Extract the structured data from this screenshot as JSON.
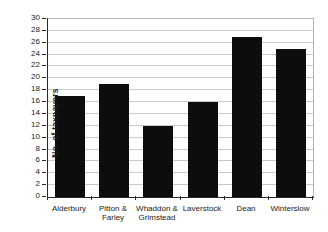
{
  "chart_data": {
    "type": "bar",
    "title": "",
    "xlabel": "",
    "ylabel": "No. of taxpayers",
    "ylim": [
      0,
      30
    ],
    "ytick_step": 2,
    "grid": "horizontal-on",
    "legend": "none",
    "categories": [
      "Alderbury",
      "Pitton &\nFarley",
      "Whaddon &\nGrimstead",
      "Laverstock",
      "Dean",
      "Winterslow"
    ],
    "values": [
      17,
      19,
      12,
      16,
      27,
      25
    ],
    "colors": {
      "bar": "#0d0d0d",
      "gridline": "#c9c9c9",
      "axis": "#2a2a2a",
      "background": "#ffffff",
      "plot_border": "#b4b4b4",
      "text": "#1a1a1a"
    }
  }
}
